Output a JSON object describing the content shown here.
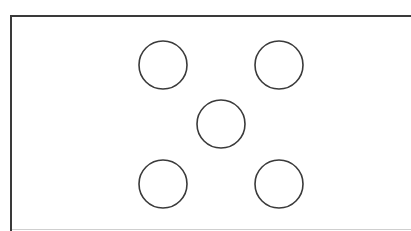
{
  "diagram": {
    "stroke_color": "#3a3a3a",
    "fill_color": "#ffffff",
    "frame": {
      "x": 10,
      "y": 15,
      "border_color": "#3a3a3a",
      "bottom_line_color": "#cfcfcf"
    },
    "circles": [
      {
        "id": "top-left",
        "cx": 163,
        "cy": 65,
        "r": 24
      },
      {
        "id": "top-right",
        "cx": 279,
        "cy": 65,
        "r": 24
      },
      {
        "id": "center",
        "cx": 221,
        "cy": 124,
        "r": 24
      },
      {
        "id": "bottom-left",
        "cx": 163,
        "cy": 184,
        "r": 24
      },
      {
        "id": "bottom-right",
        "cx": 279,
        "cy": 184,
        "r": 24
      }
    ]
  }
}
